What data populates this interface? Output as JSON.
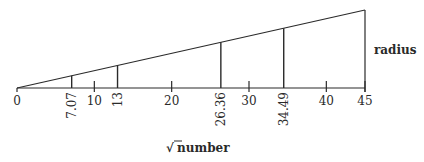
{
  "diagram": {
    "type": "linear-scale-wedge",
    "x_axis_title_symbol": "√",
    "x_axis_title": "number",
    "y_axis_title": "radius",
    "axis_min": 0,
    "axis_max": 45,
    "major_ticks": [
      {
        "value": 0,
        "label": "0"
      },
      {
        "value": 10,
        "label": "10"
      },
      {
        "value": 20,
        "label": "20"
      },
      {
        "value": 30,
        "label": "30"
      },
      {
        "value": 40,
        "label": "40"
      },
      {
        "value": 45,
        "label": "45"
      }
    ],
    "marked_values": [
      {
        "value": 7.07,
        "label": "7.07"
      },
      {
        "value": 13,
        "label": "13"
      },
      {
        "value": 26.36,
        "label": "26.36"
      },
      {
        "value": 34.49,
        "label": "34.49"
      }
    ],
    "colors": {
      "line": "#2a2a2a",
      "background": "#ffffff"
    }
  }
}
